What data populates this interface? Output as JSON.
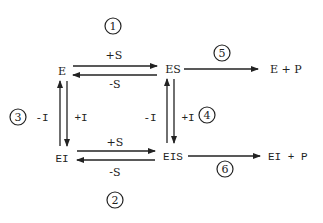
{
  "diagram": {
    "type": "enzyme inhibition kinetic scheme",
    "nodes": {
      "e": "E",
      "es": "ES",
      "ei": "EI",
      "eis": "EIS",
      "product_es": "E + P",
      "product_eis": "EI + P"
    },
    "edges": {
      "e_es_forward": "+S",
      "es_e_reverse": "-S",
      "ei_eis_forward": "+S",
      "eis_ei_reverse": "-S",
      "ei_e_up": "-I",
      "e_ei_down": "+I",
      "eis_es_up": "-I",
      "es_eis_down": "+I"
    },
    "step_numbers": {
      "top_equilibrium": "1",
      "bottom_equilibrium": "2",
      "left_equilibrium": "3",
      "right_equilibrium": "4",
      "es_product": "5",
      "eis_product": "6"
    },
    "color": "#222222"
  }
}
